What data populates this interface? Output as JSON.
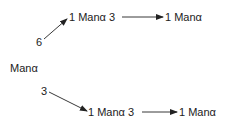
{
  "diagram": {
    "root": {
      "label": "Manα"
    },
    "branch_top": {
      "link": "6",
      "node1": "1 Manα 3",
      "node2": "1 Manα"
    },
    "branch_bottom": {
      "link": "3",
      "node1": "1 Manα 3",
      "node2": "1 Manα"
    },
    "colors": {
      "text": "#222222",
      "line": "#222222",
      "background": "#ffffff"
    }
  }
}
